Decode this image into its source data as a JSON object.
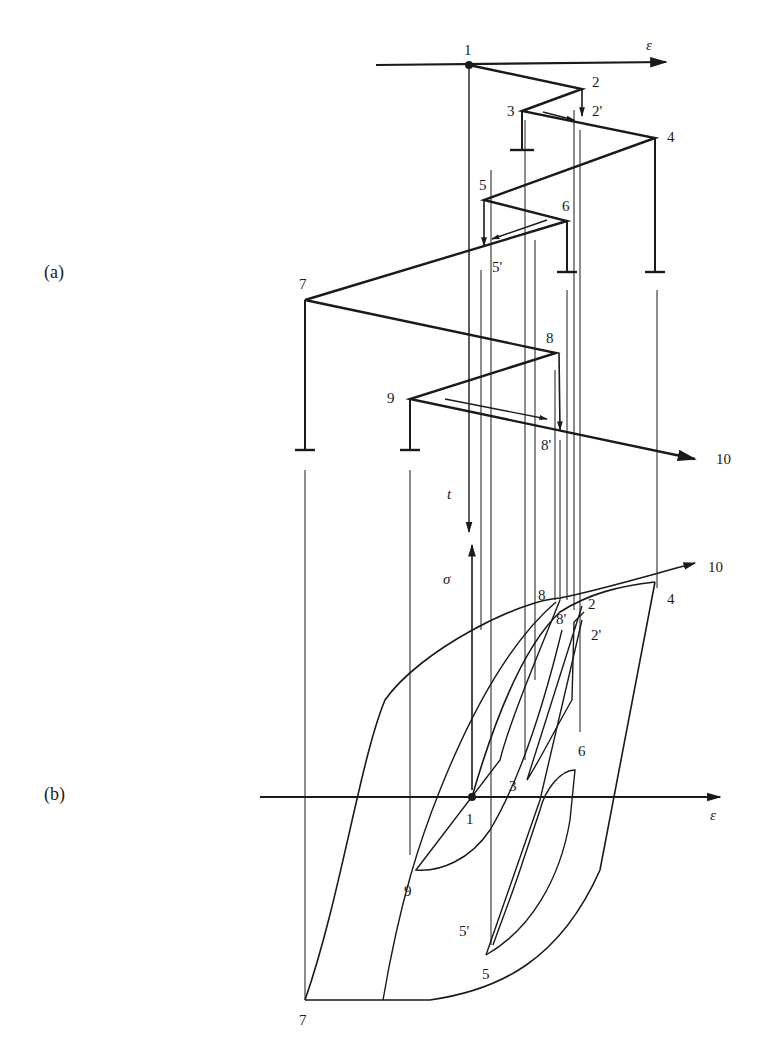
{
  "figure": {
    "panels": [
      {
        "id": "a",
        "label": "(a)",
        "description": "Strain history versus time"
      },
      {
        "id": "b",
        "label": "(b)",
        "description": "Stress-strain response (hysteresis loops)"
      }
    ],
    "axes": {
      "a_horizontal": "ε",
      "a_vertical": "t",
      "b_horizontal": "ε",
      "b_vertical": "σ"
    },
    "points_a": [
      "1",
      "2",
      "2'",
      "3",
      "4",
      "5",
      "5'",
      "6",
      "7",
      "8",
      "8'",
      "9",
      "10"
    ],
    "points_b": [
      "1",
      "2",
      "2'",
      "3",
      "4",
      "5",
      "5'",
      "6",
      "7",
      "8",
      "8'",
      "9",
      "10"
    ],
    "colors": {
      "ink": "#1a1a1a",
      "background": "#ffffff"
    }
  },
  "labels": {
    "panel_a": "(a)",
    "panel_b": "(b)",
    "eps_top": "ε",
    "t_axis": "t",
    "sigma_axis": "σ",
    "eps_bottom": "ε",
    "a": {
      "p1": "1",
      "p2": "2",
      "p2p": "2'",
      "p3": "3",
      "p4": "4",
      "p5": "5",
      "p5p": "5'",
      "p6": "6",
      "p7": "7",
      "p8": "8",
      "p8p": "8'",
      "p9": "9",
      "p10": "10"
    },
    "b": {
      "p1": "1",
      "p2": "2",
      "p2p": "2'",
      "p3": "3",
      "p4": "4",
      "p5": "5",
      "p5p": "5'",
      "p6": "6",
      "p7": "7",
      "p8": "8",
      "p8p": "8'",
      "p9": "9",
      "p10": "10"
    }
  }
}
